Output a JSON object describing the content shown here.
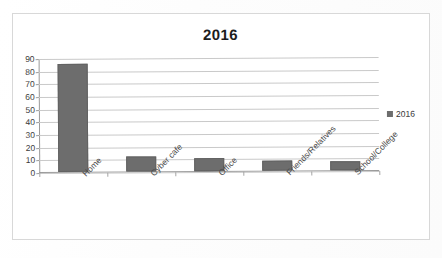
{
  "chart_data": {
    "type": "bar",
    "title": "2016",
    "xlabel": "",
    "ylabel": "",
    "categories": [
      "Home",
      "Cyber cafe",
      "Office",
      "Friends/Relatives",
      "School/College"
    ],
    "values": [
      85,
      12,
      10,
      8,
      7
    ],
    "series": [
      {
        "name": "2016",
        "values": [
          85,
          12,
          10,
          8,
          7
        ],
        "color": "#6d6d6d"
      }
    ],
    "ylim": [
      0,
      90
    ],
    "ytick_step": 10,
    "yticks": [
      90,
      80,
      70,
      60,
      50,
      40,
      30,
      20,
      10,
      0
    ],
    "grid": true,
    "legend": [
      "2016"
    ],
    "legend_position": "right"
  },
  "legend": {
    "entry_label": "2016",
    "swatch_color": "#6d6d6d"
  },
  "colors": {
    "bar": "#6d6d6d",
    "gridline": "#c9c9c9",
    "axis": "#9a9a9a",
    "frame": "#d8d8d8",
    "title_text": "#1d1d1d",
    "tick_text": "#3a3a3a",
    "category_text": "#4a4a4a"
  }
}
